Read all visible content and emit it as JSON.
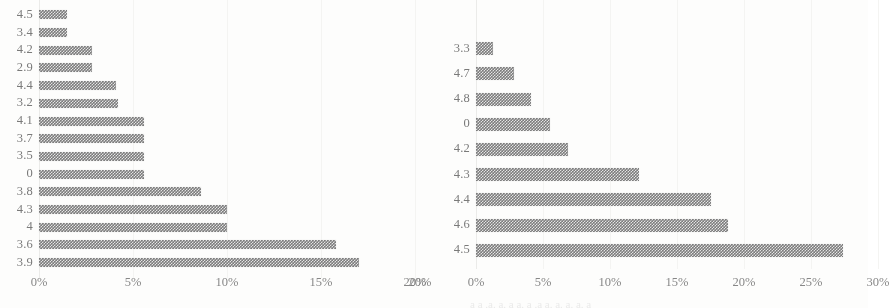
{
  "figure": {
    "background_color": "#fdfdfc",
    "bar_color": "#7c7c7c",
    "label_color": "#6f6f6f",
    "gridline_color": "#f2f2f0",
    "caption_remnant": "a a .a. a. a a. a .a a. a. a. a. a"
  },
  "chart_data": [
    {
      "type": "bar",
      "orientation": "horizontal",
      "title": "",
      "subtitle": "",
      "xlabel": "",
      "ylabel": "",
      "xlim": [
        0,
        20
      ],
      "xticks": [
        "0%",
        "5%",
        "10%",
        "15%",
        "20%"
      ],
      "xtick_values": [
        0,
        5,
        10,
        15,
        20
      ],
      "grid": true,
      "grid_axis": "x",
      "legend": false,
      "legend_position": "none",
      "categories": [
        "4.5",
        "3.4",
        "4.2",
        "2.9",
        "4.4",
        "3.2",
        "4.1",
        "3.7",
        "3.5",
        "0",
        "3.8",
        "4.3",
        "4",
        "3.6",
        "3.9"
      ],
      "values": [
        1.5,
        1.5,
        2.8,
        2.8,
        4.1,
        4.2,
        5.6,
        5.6,
        5.6,
        5.6,
        8.6,
        10.0,
        10.0,
        15.8,
        17.0
      ],
      "value_labels": [
        "",
        "",
        "",
        "",
        "",
        "",
        "",
        "",
        "",
        "",
        "",
        "",
        "",
        "",
        ""
      ]
    },
    {
      "type": "bar",
      "orientation": "horizontal",
      "title": "",
      "subtitle": "",
      "xlabel": "",
      "ylabel": "",
      "xlim": [
        0,
        30
      ],
      "xticks": [
        "0%",
        "5%",
        "10%",
        "15%",
        "20%",
        "25%",
        "30%"
      ],
      "xtick_values": [
        0,
        5,
        10,
        15,
        20,
        25,
        30
      ],
      "grid": true,
      "grid_axis": "x",
      "legend": false,
      "legend_position": "none",
      "categories": [
        "3.3",
        "4.7",
        "4.8",
        "0",
        "4.2",
        "4.3",
        "4.4",
        "4.6",
        "4.5"
      ],
      "values": [
        1.3,
        2.8,
        4.1,
        5.5,
        6.9,
        12.2,
        17.5,
        18.8,
        27.4
      ],
      "value_labels": [
        "",
        "",
        "",
        "",
        "",
        "",
        "",
        "",
        ""
      ]
    }
  ]
}
